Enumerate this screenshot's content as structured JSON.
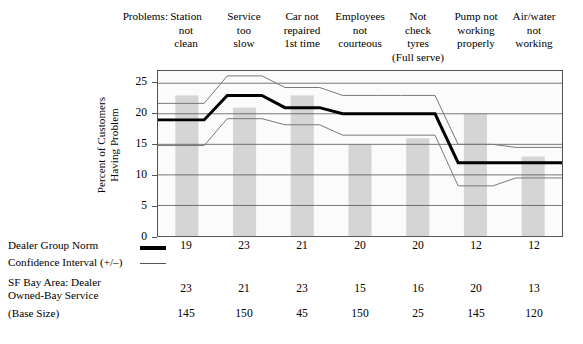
{
  "header": {
    "problems_label": "Problems:",
    "categories": [
      "Station\nnot\nclean",
      "Service\ntoo\nslow",
      "Car not\nrepaired\n1st time",
      "Employees\nnot\ncourteous",
      "Not\ncheck\ntyres\n(Full serve)",
      "Pump not\nworking\nproperly",
      "Air/water\nnot\nworking"
    ]
  },
  "chart": {
    "ylabel": "Percent of Customers\nHaving Problem",
    "yticks": [
      "0",
      "5",
      "10",
      "15",
      "20",
      "25"
    ]
  },
  "legend": {
    "norm_label": "Dealer Group Norm",
    "ci_label": "Confidence Interval (+/–)",
    "bay_label": "SF Bay Area: Dealer\nOwned-Bay Service",
    "base_label": "(Base Size)"
  },
  "chart_data": {
    "type": "bar",
    "title": "",
    "xlabel": "",
    "ylabel": "Percent of Customers Having Problem",
    "ylim": [
      0,
      27
    ],
    "yticks": [
      0,
      5,
      10,
      15,
      20,
      25
    ],
    "grid": true,
    "legend_position": "below",
    "categories": [
      "Station not clean",
      "Service too slow",
      "Car not repaired 1st time",
      "Employees not courteous",
      "Not check tyres (Full serve)",
      "Pump not working properly",
      "Air/water not working"
    ],
    "series": [
      {
        "name": "SF Bay Area: Dealer Owned-Bay Service",
        "type": "bar",
        "color": "#d5d5d5",
        "values": [
          23,
          21,
          23,
          15,
          16,
          20,
          13
        ]
      },
      {
        "name": "Dealer Group Norm",
        "type": "line",
        "color": "#000000",
        "values": [
          19,
          23,
          21,
          20,
          20,
          12,
          12
        ]
      },
      {
        "name": "Confidence Interval upper (+)",
        "type": "line",
        "color": "#777777",
        "values": [
          21.7,
          26.2,
          24.3,
          23,
          23,
          15,
          14.5
        ]
      },
      {
        "name": "Confidence Interval lower (–)",
        "type": "line",
        "color": "#777777",
        "values": [
          14.8,
          19.2,
          18.2,
          16.5,
          16.5,
          8.2,
          9.5
        ]
      }
    ],
    "base_size": [
      145,
      150,
      45,
      150,
      25,
      145,
      120
    ]
  }
}
